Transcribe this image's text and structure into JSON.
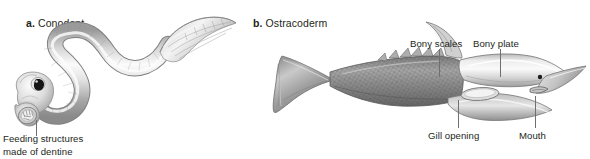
{
  "figure": {
    "background_color": "#ffffff",
    "line_color": "#6f6f70",
    "text_color": "#231f20",
    "art_light": "#f2f2f2",
    "art_mid": "#a8a8a8",
    "art_dark": "#555555"
  },
  "panels": [
    {
      "id": "a",
      "letter": "a.",
      "title": "Conodont",
      "subject_icon": "conodont-eel-illustration",
      "callouts": [
        {
          "name": "feeding-structures",
          "text": "Feeding structures made of dentine",
          "line1": "Feeding structures",
          "line2": "made of dentine"
        }
      ]
    },
    {
      "id": "b",
      "letter": "b.",
      "title": "Ostracoderm",
      "subject_icon": "ostracoderm-jawless-fish-illustration",
      "callouts": [
        {
          "name": "bony-scales",
          "text": "Bony scales"
        },
        {
          "name": "bony-plate",
          "text": "Bony plate"
        },
        {
          "name": "gill-opening",
          "text": "Gill opening"
        },
        {
          "name": "mouth",
          "text": "Mouth"
        }
      ]
    }
  ]
}
